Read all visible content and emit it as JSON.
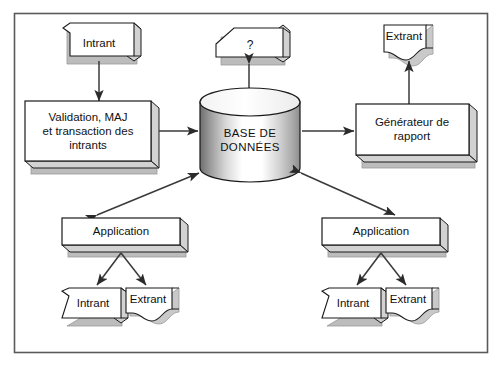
{
  "diagram": {
    "frame": {
      "stroke": "#555555",
      "fill": "#ffffff"
    },
    "colors": {
      "shape_fill": "#ffffff",
      "shape_stroke": "#1a1a1a",
      "shadow_fill": "#bcbcbc",
      "side_fill": "#d2d2d2",
      "arrow": "#4a4a4a",
      "cylinder_light": "#ffffff",
      "cylinder_dark": "#7a7a7a"
    },
    "nodes": [
      {
        "id": "intrant-top-left",
        "label": "Intrant",
        "shape": "cut-corner-box"
      },
      {
        "id": "validation",
        "label_lines": [
          "Validation, MAJ",
          "et transaction des",
          "intrants"
        ],
        "shape": "box"
      },
      {
        "id": "question",
        "label": "?",
        "shape": "slanted-box"
      },
      {
        "id": "database",
        "label_lines": [
          "BASE DE",
          "DONNÉES"
        ],
        "shape": "cylinder"
      },
      {
        "id": "extrant-top-right",
        "label": "Extrant",
        "shape": "document"
      },
      {
        "id": "generateur",
        "label_lines": [
          "Générateur de",
          "rapport"
        ],
        "shape": "box"
      },
      {
        "id": "application-left",
        "label": "Application",
        "shape": "box"
      },
      {
        "id": "intrant-bottom-left",
        "label": "Intrant",
        "shape": "cut-corner-box"
      },
      {
        "id": "extrant-bottom-left",
        "label": "Extrant",
        "shape": "document"
      },
      {
        "id": "application-right",
        "label": "Application",
        "shape": "box"
      },
      {
        "id": "intrant-bottom-right",
        "label": "Intrant",
        "shape": "cut-corner-box"
      },
      {
        "id": "extrant-bottom-right",
        "label": "Extrant",
        "shape": "document"
      }
    ],
    "edges": [
      {
        "from": "intrant-top-left",
        "to": "validation",
        "heads": "end"
      },
      {
        "from": "validation",
        "to": "database",
        "heads": "end"
      },
      {
        "from": "question",
        "to": "database",
        "heads": "both"
      },
      {
        "from": "database",
        "to": "generateur",
        "heads": "end"
      },
      {
        "from": "generateur",
        "to": "extrant-top-right",
        "heads": "end"
      },
      {
        "from": "application-left",
        "to": "database",
        "heads": "both"
      },
      {
        "from": "database",
        "to": "application-right",
        "heads": "both"
      },
      {
        "from": "application-left",
        "to": "intrant-bottom-left",
        "heads": "end"
      },
      {
        "from": "application-left",
        "to": "extrant-bottom-left",
        "heads": "end"
      },
      {
        "from": "application-right",
        "to": "intrant-bottom-right",
        "heads": "end"
      },
      {
        "from": "application-right",
        "to": "extrant-bottom-right",
        "heads": "end"
      }
    ]
  },
  "labels": {
    "intrant_top_left": "Intrant",
    "validation_l1": "Validation, MAJ",
    "validation_l2": "et transaction des",
    "validation_l3": "intrants",
    "question": "?",
    "database_l1": "BASE DE",
    "database_l2": "DONNÉES",
    "extrant_top_right": "Extrant",
    "generateur_l1": "Générateur de",
    "generateur_l2": "rapport",
    "application_left": "Application",
    "intrant_bottom_left": "Intrant",
    "extrant_bottom_left": "Extrant",
    "application_right": "Application",
    "intrant_bottom_right": "Intrant",
    "extrant_bottom_right": "Extrant"
  }
}
